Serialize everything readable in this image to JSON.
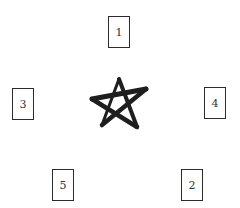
{
  "diagram": {
    "center_symbol": "pentagram-star",
    "stroke_color": "#1e1e1e",
    "cards": [
      {
        "label": "1",
        "position": "top"
      },
      {
        "label": "2",
        "position": "bottom-right"
      },
      {
        "label": "3",
        "position": "left"
      },
      {
        "label": "4",
        "position": "right"
      },
      {
        "label": "5",
        "position": "bottom-left"
      }
    ]
  }
}
